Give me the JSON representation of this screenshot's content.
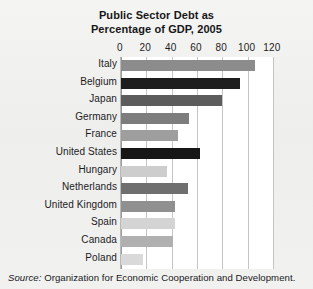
{
  "chart_data": {
    "type": "bar",
    "orientation": "horizontal",
    "title": "Public Sector Debt as Percentage of GDP, 2005",
    "title_lines": [
      "Public Sector Debt as",
      "Percentage of GDP, 2005"
    ],
    "xlabel": "",
    "ylabel": "",
    "xlim": [
      0,
      120
    ],
    "xticks": [
      0,
      20,
      40,
      60,
      80,
      100,
      120
    ],
    "xtick_labels": [
      "0",
      "20",
      "40",
      "60",
      "80",
      "100",
      "120"
    ],
    "grid": "vertical",
    "legend": "none",
    "categories": [
      "Italy",
      "Belgium",
      "Japan",
      "Germany",
      "France",
      "United States",
      "Hungary",
      "Netherlands",
      "United Kingdom",
      "Spain",
      "Canada",
      "Poland"
    ],
    "values": [
      106,
      94,
      80,
      54,
      45,
      62,
      36,
      53,
      43,
      43,
      41,
      17
    ],
    "bar_colors": [
      "#8c8c8c",
      "#1e1e1e",
      "#5c5c5c",
      "#7d7d7d",
      "#9e9e9e",
      "#161616",
      "#cdcdcd",
      "#6f6f6f",
      "#909090",
      "#d4d4d4",
      "#b0b0b0",
      "#d9d9d9"
    ],
    "bars": [
      {
        "category": "Italy",
        "value": 106,
        "color": "#8c8c8c"
      },
      {
        "category": "Belgium",
        "value": 94,
        "color": "#1e1e1e"
      },
      {
        "category": "Japan",
        "value": 80,
        "color": "#5c5c5c"
      },
      {
        "category": "Germany",
        "value": 54,
        "color": "#7d7d7d"
      },
      {
        "category": "France",
        "value": 45,
        "color": "#9e9e9e"
      },
      {
        "category": "United States",
        "value": 62,
        "color": "#161616"
      },
      {
        "category": "Hungary",
        "value": 36,
        "color": "#cdcdcd"
      },
      {
        "category": "Netherlands",
        "value": 53,
        "color": "#6f6f6f"
      },
      {
        "category": "United Kingdom",
        "value": 43,
        "color": "#909090"
      },
      {
        "category": "Spain",
        "value": 43,
        "color": "#d4d4d4"
      },
      {
        "category": "Canada",
        "value": 41,
        "color": "#b0b0b0"
      },
      {
        "category": "Poland",
        "value": 17,
        "color": "#d9d9d9"
      }
    ]
  },
  "source": {
    "prefix": "Source:",
    "text": "Organization for Economic Cooperation and Development."
  },
  "colors": {
    "page_background": "#f1f1ef",
    "plot_background": "#ffffff",
    "gridline": "#c4c4c2",
    "axis": "#9a9a98",
    "text": "#1b1b1e"
  }
}
